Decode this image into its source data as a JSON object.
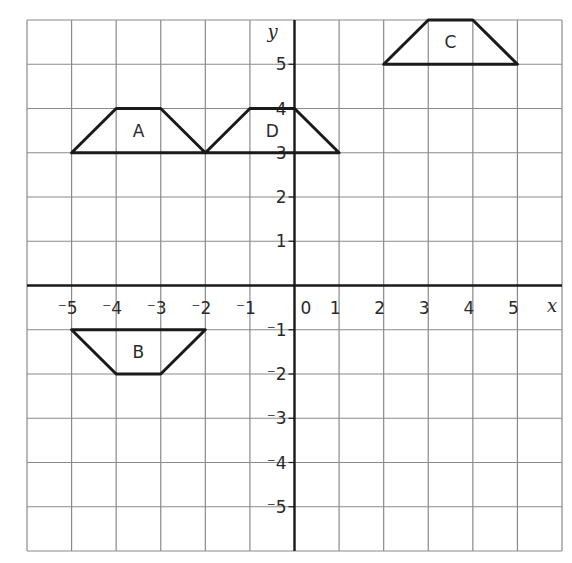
{
  "chart_data": {
    "type": "coordinate-grid",
    "title": "",
    "xlabel": "x",
    "ylabel": "y",
    "xlim": [
      -6,
      6
    ],
    "ylim": [
      -6,
      6
    ],
    "grid": true,
    "x_ticks": [
      -5,
      -4,
      -3,
      -2,
      -1,
      0,
      1,
      2,
      3,
      4,
      5
    ],
    "y_ticks": [
      -5,
      -4,
      -3,
      -2,
      -1,
      1,
      2,
      3,
      4,
      5
    ],
    "shapes": [
      {
        "label": "A",
        "type": "trapezium",
        "vertices": [
          [
            -5,
            3
          ],
          [
            -4,
            4
          ],
          [
            -3,
            4
          ],
          [
            -2,
            3
          ]
        ],
        "label_pos": [
          -3.5,
          3.5
        ]
      },
      {
        "label": "B",
        "type": "trapezium",
        "vertices": [
          [
            -5,
            -1
          ],
          [
            -2,
            -1
          ],
          [
            -3,
            -2
          ],
          [
            -4,
            -2
          ]
        ],
        "label_pos": [
          -3.5,
          -1.5
        ]
      },
      {
        "label": "C",
        "type": "trapezium",
        "vertices": [
          [
            2,
            5
          ],
          [
            3,
            6
          ],
          [
            4,
            6
          ],
          [
            5,
            5
          ]
        ],
        "label_pos": [
          3.5,
          5.5
        ]
      },
      {
        "label": "D",
        "type": "trapezium",
        "vertices": [
          [
            -2,
            3
          ],
          [
            -1,
            4
          ],
          [
            0,
            4
          ],
          [
            1,
            3
          ]
        ],
        "label_pos": [
          -0.5,
          3.5
        ]
      }
    ]
  },
  "colors": {
    "grid": "#8a8a8a",
    "axis": "#1a1a1a",
    "shape_stroke": "#1a1a1a",
    "text": "#2a2a2a"
  }
}
